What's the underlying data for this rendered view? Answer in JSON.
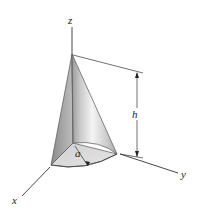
{
  "figure": {
    "type": "3d-geometry-diagram",
    "labels": {
      "z_axis": "z",
      "x_axis": "x",
      "y_axis": "y",
      "height": "h",
      "radius": "a"
    },
    "colors": {
      "axis_line": "#333333",
      "cone_light": "#f2f2f2",
      "cone_mid": "#c8c8c8",
      "cone_dark": "#8a8a8a",
      "base_fill": "#d9d9d9"
    }
  }
}
